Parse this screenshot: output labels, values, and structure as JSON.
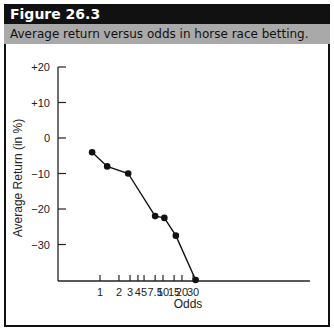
{
  "figure": {
    "number_label": "Figure 26.3",
    "caption": "Average return versus odds in horse race betting."
  },
  "chart_data": {
    "type": "line",
    "title": "Average return versus odds in horse race betting.",
    "xlabel": "Odds",
    "ylabel": "Average Return (in %)",
    "x_scale": "log",
    "x_ticks": [
      "1",
      "2",
      "3",
      "4",
      "5",
      "7.5",
      "10",
      "15",
      "20",
      "30"
    ],
    "y_ticks": [
      "+20",
      "+10",
      "0",
      "−10",
      "−20",
      "−30"
    ],
    "ylim": [
      -40,
      20
    ],
    "grid": false,
    "legend": null,
    "series": [
      {
        "name": "Average return",
        "x": [
          0.75,
          1.3,
          2.8,
          7.5,
          10.5,
          16,
          33
        ],
        "y": [
          -4,
          -8,
          -10,
          -22,
          -22.5,
          -27.5,
          -40
        ]
      }
    ]
  }
}
